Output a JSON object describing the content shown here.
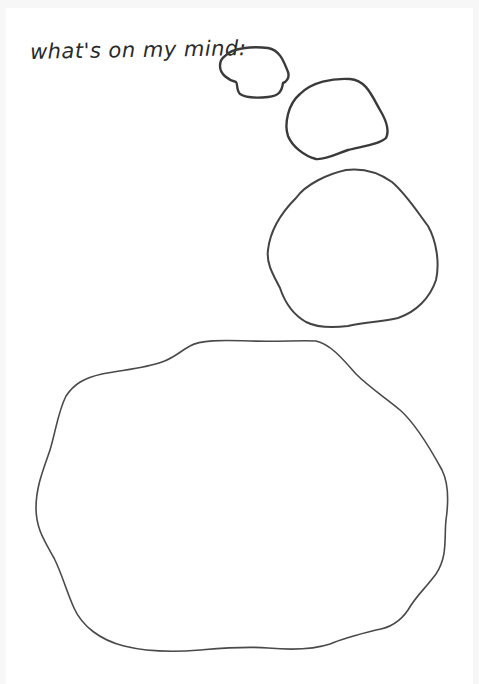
{
  "caption": "what's on my mind:",
  "colors": {
    "background": "#ffffff",
    "ink": "#3a3a3a"
  },
  "bubbles": [
    {
      "name": "bubble-small"
    },
    {
      "name": "bubble-medium"
    },
    {
      "name": "bubble-large"
    },
    {
      "name": "bubble-main"
    }
  ]
}
